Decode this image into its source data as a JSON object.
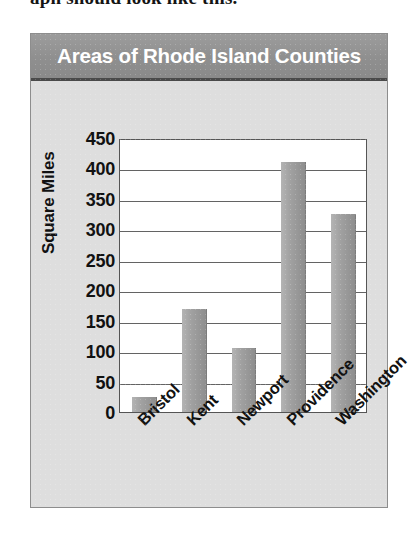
{
  "caption": {
    "clipped_text": "aph should look like this."
  },
  "figure": {
    "title": "Areas of Rhode Island Counties"
  },
  "colors": {
    "title_bar": "#8f8f8f",
    "title_text": "#ffffff",
    "panel_background": "#dedede",
    "plot_background": "#ffffff",
    "bar_fill": "#a0a0a0",
    "gridline": "#636363",
    "axis_text": "#111111"
  },
  "chart_data": {
    "type": "bar",
    "title": "Areas of Rhode Island Counties",
    "xlabel": "",
    "ylabel": "Square Miles",
    "categories": [
      "Bristol",
      "Kent",
      "Newport",
      "Providence",
      "Washington"
    ],
    "values": [
      25,
      170,
      105,
      410,
      325
    ],
    "ylim": [
      0,
      450
    ],
    "ytick_step": 50,
    "yticks": [
      450,
      400,
      350,
      300,
      250,
      200,
      150,
      100,
      50,
      0
    ],
    "grid": true,
    "legend": "none",
    "orientation": "vertical"
  }
}
